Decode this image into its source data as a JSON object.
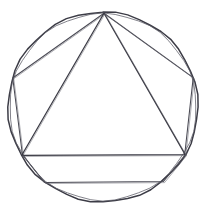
{
  "figure": {
    "title": "Circle with inscribed heptagon and inscribed triangle",
    "background_color": "#ffffff",
    "stroke_color": "#3c3c46",
    "canvas": {
      "width": 209,
      "height": 212
    }
  },
  "chart_data": {
    "type": "scatter",
    "title": "Circle with inscribed heptagon and inscribed triangle",
    "xlabel": "",
    "ylabel": "",
    "grid": false,
    "legend": "none",
    "xlim": [
      0,
      209
    ],
    "ylim": [
      0,
      212
    ],
    "geometry": {
      "circle": {
        "name": "circumscribed-circle",
        "center_x": 103,
        "center_y": 107,
        "radius": 95,
        "stroke_width": 1.5
      },
      "heptagon": {
        "name": "inscribed-heptagon",
        "sides": 7,
        "vertex_count": 7,
        "vertices": [
          {
            "label": "apex",
            "x": 104,
            "y": 13
          },
          {
            "label": "upper-right",
            "x": 193,
            "y": 78
          },
          {
            "label": "right",
            "x": 185,
            "y": 155
          },
          {
            "label": "lower-right",
            "x": 163,
            "y": 182
          },
          {
            "label": "lower-left",
            "x": 45,
            "y": 182
          },
          {
            "label": "left",
            "x": 22,
            "y": 155
          },
          {
            "label": "upper-left",
            "x": 13,
            "y": 78
          }
        ]
      },
      "triangle": {
        "name": "inscribed-triangle",
        "sides": 3,
        "vertex_count": 3,
        "vertices": [
          {
            "label": "apex",
            "x": 104,
            "y": 13
          },
          {
            "label": "base-right",
            "x": 185,
            "y": 155
          },
          {
            "label": "base-left",
            "x": 22,
            "y": 155
          }
        ],
        "base_y": 155
      },
      "chords": [
        {
          "name": "heptagon-edge-1",
          "from": "apex",
          "to": "upper-right"
        },
        {
          "name": "heptagon-edge-2",
          "from": "upper-right",
          "to": "right"
        },
        {
          "name": "heptagon-edge-3",
          "from": "right",
          "to": "lower-right"
        },
        {
          "name": "heptagon-edge-4",
          "from": "lower-right",
          "to": "lower-left"
        },
        {
          "name": "heptagon-edge-5",
          "from": "lower-left",
          "to": "left"
        },
        {
          "name": "heptagon-edge-6",
          "from": "left",
          "to": "upper-left"
        },
        {
          "name": "heptagon-edge-7",
          "from": "upper-left",
          "to": "apex"
        },
        {
          "name": "triangle-edge-1",
          "from": "apex",
          "to": "base-right"
        },
        {
          "name": "triangle-edge-2",
          "from": "base-right",
          "to": "base-left"
        },
        {
          "name": "triangle-edge-3",
          "from": "base-left",
          "to": "apex"
        }
      ]
    }
  }
}
